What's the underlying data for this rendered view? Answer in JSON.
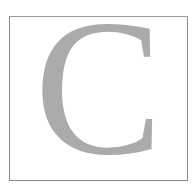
{
  "tile": {
    "letter": "C",
    "letter_color": "#ababab",
    "border_color": "#8a8a8a",
    "background": "#ffffff"
  }
}
